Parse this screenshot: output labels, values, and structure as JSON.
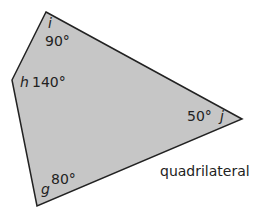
{
  "shape": {
    "name": "quadrilateral",
    "fill": "#c6c6c6",
    "stroke": "#222222",
    "vertices": [
      {
        "name": "i",
        "x": 46,
        "y": 12,
        "angle": "90°"
      },
      {
        "name": "j",
        "x": 242,
        "y": 119,
        "angle": "50°"
      },
      {
        "name": "g",
        "x": 37,
        "y": 206,
        "angle": "80°"
      },
      {
        "name": "h",
        "x": 12,
        "y": 80,
        "angle": "140°"
      }
    ]
  },
  "caption": "quadrilateral"
}
